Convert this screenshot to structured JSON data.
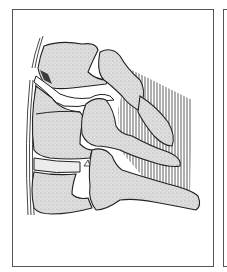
{
  "figure": {
    "panels": [
      {
        "id": "main",
        "content": "spine-fracture-illustration"
      },
      {
        "id": "next",
        "content": "partially visible adjacent panel"
      }
    ],
    "colors": {
      "frame": "#555555",
      "bone_fill": "#d9d9d9",
      "bone_outline": "#2a2a2a",
      "ligament_lines": "#3a3a3a",
      "gap": "#ffffff",
      "shadow": "#3c3c3c"
    }
  }
}
